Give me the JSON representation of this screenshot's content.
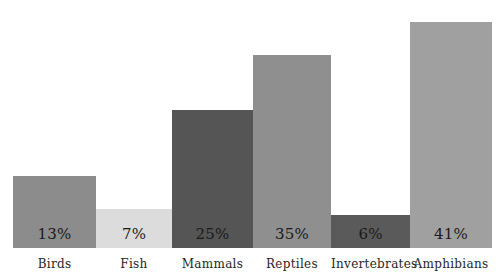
{
  "chart_data": {
    "type": "bar",
    "title": "",
    "subtitle": "",
    "xlabel": "",
    "ylabel": "",
    "ylim": [
      0,
      45
    ],
    "grid": false,
    "legend": false,
    "categories": [
      "Birds",
      "Fish",
      "Mammals",
      "Reptiles",
      "Invertebrates",
      "Amphibians"
    ],
    "values": [
      13,
      7,
      25,
      35,
      6,
      41
    ],
    "value_labels": [
      "13%",
      "7%",
      "25%",
      "35%",
      "6%",
      "41%"
    ],
    "bar_colors": [
      "#8c8c8c",
      "#dcdcdc",
      "#555555",
      "#8f8f8f",
      "#5a5a5a",
      "#a0a0a0"
    ],
    "bar_widths_px": [
      83,
      76,
      81,
      78,
      79,
      82
    ],
    "background_color": "#ffffff",
    "label_color": "#262626",
    "value_color": "#1a1a1a",
    "bars": [
      {
        "category": "Birds",
        "value": 13,
        "value_label": "13%",
        "color": "#8c8c8c",
        "width_px": 83
      },
      {
        "category": "Fish",
        "value": 7,
        "value_label": "7%",
        "color": "#dcdcdc",
        "width_px": 76
      },
      {
        "category": "Mammals",
        "value": 25,
        "value_label": "25%",
        "color": "#555555",
        "width_px": 81
      },
      {
        "category": "Reptiles",
        "value": 35,
        "value_label": "35%",
        "color": "#8f8f8f",
        "width_px": 78
      },
      {
        "category": "Invertebrates",
        "value": 6,
        "value_label": "6%",
        "color": "#5a5a5a",
        "width_px": 79
      },
      {
        "category": "Amphibians",
        "value": 41,
        "value_label": "41%",
        "color": "#a0a0a0",
        "width_px": 82
      }
    ]
  }
}
